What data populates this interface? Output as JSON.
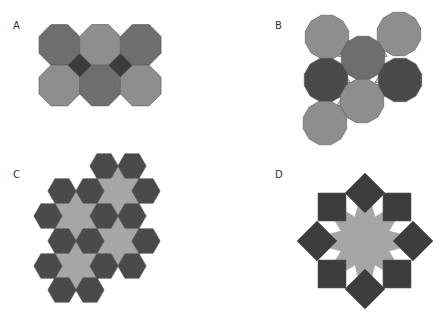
{
  "panels": [
    {
      "label": "A",
      "tiling": "octagons-and-squares",
      "label_pos": [
        13,
        20
      ]
    },
    {
      "label": "B",
      "tiling": "dodecagons-and-triangles",
      "label_pos": [
        275,
        20
      ]
    },
    {
      "label": "C",
      "tiling": "hexagons-and-hexagrams",
      "label_pos": [
        13,
        169
      ]
    },
    {
      "label": "D",
      "tiling": "eight-pointed-star-with-squares",
      "label_pos": [
        275,
        169
      ]
    }
  ],
  "colors": {
    "background": "#ffffff",
    "light_tile": "#8e8e8e",
    "mid_tile": "#6e6e6e",
    "dark_tile": "#4a4a4a",
    "darkest_tile": "#3c3c3c",
    "pale_fill": "#a6a6a6",
    "gap_fill": "#c8c8c8",
    "stroke": "#5a5a5a"
  }
}
